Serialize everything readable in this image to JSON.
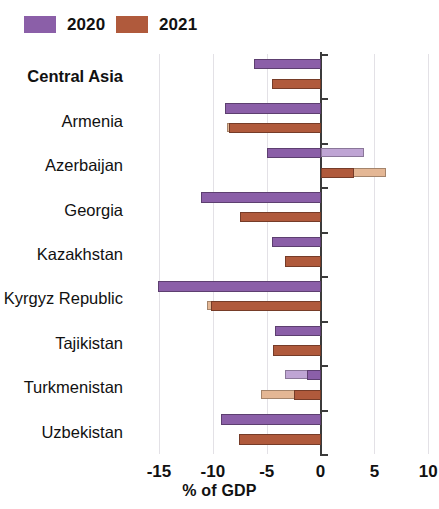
{
  "legend": {
    "items": [
      {
        "label": "2020",
        "color": "#8B5FA8",
        "pale_color": "#BFA5D4",
        "name": "legend-2020"
      },
      {
        "label": "2021",
        "color": "#B05A3C",
        "pale_color": "#E4B795",
        "name": "legend-2021"
      }
    ]
  },
  "axis": {
    "title": "% of GDP",
    "ticks": [
      "-15",
      "-10",
      "-5",
      "0",
      "5",
      "10"
    ],
    "tick_values": [
      -15,
      -10,
      -5,
      0,
      5,
      10
    ]
  },
  "chart_data": {
    "type": "bar",
    "orientation": "horizontal",
    "title": "",
    "subtitle": "",
    "xlabel": "% of GDP",
    "ylabel": "",
    "xlim": [
      -17.6,
      11.0
    ],
    "grid": true,
    "legend_position": "top-left",
    "categories": [
      "Central Asia",
      "Armenia",
      "Azerbaijan",
      "Georgia",
      "Kazakhstan",
      "Kyrgyz Republic",
      "Tajikistan",
      "Turkmenistan",
      "Uzbekistan"
    ],
    "highlighted_category": "Central Asia",
    "series": [
      {
        "name": "2020",
        "values": [
          -6.2,
          -8.9,
          -5.0,
          -11.1,
          -4.5,
          -15.1,
          -4.2,
          -1.3,
          -9.2
        ]
      },
      {
        "name": "2021",
        "values": [
          -4.5,
          -8.5,
          3.1,
          -7.5,
          -3.3,
          -10.2,
          -4.4,
          -2.5,
          -7.6
        ]
      },
      {
        "name": "2020 secondary",
        "values": [
          -3.3,
          -8.9,
          4.0,
          -3.3,
          -2.8,
          -12.5,
          -3.4,
          -3.3,
          -3.3
        ]
      },
      {
        "name": "2021 secondary",
        "values": [
          -3.8,
          -8.7,
          6.1,
          -3.3,
          -3.3,
          -10.5,
          -3.6,
          -5.5,
          -3.3
        ]
      }
    ]
  }
}
